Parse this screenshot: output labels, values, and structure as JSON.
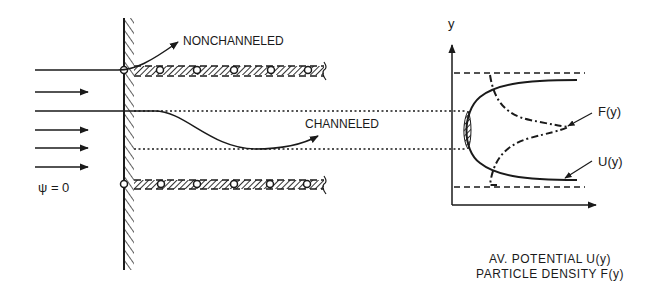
{
  "diagram": {
    "labels": {
      "nonchanneled": "NONCHANNELED",
      "channeled": "CHANNELED",
      "psi": "ψ = 0",
      "y_axis": "y",
      "F": "F(y)",
      "U": "U(y)"
    },
    "caption": {
      "line1": "AV. POTENTIAL U(y)",
      "line2": "PARTICLE DENSITY F(y)"
    },
    "colors": {
      "ink": "#1a1a1a",
      "hatch": "#555555",
      "background": "#ffffff"
    }
  }
}
